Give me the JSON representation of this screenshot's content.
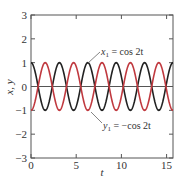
{
  "chart_data": {
    "type": "line",
    "title": "",
    "xlabel": "t",
    "ylabel": "x, y",
    "xlim": [
      0,
      15.708
    ],
    "ylim": [
      -3,
      3
    ],
    "x_ticks": [
      0,
      5,
      10,
      15
    ],
    "y_ticks": [
      -3,
      -2,
      -1,
      0,
      1,
      2,
      3
    ],
    "x_tick_labels": [
      "0",
      "5",
      "10",
      "15"
    ],
    "y_tick_labels": [
      "−3",
      "−2",
      "−1",
      "0",
      "1",
      "2",
      "3"
    ],
    "grid": false,
    "zero_line": true,
    "series": [
      {
        "name": "x1 = cos 2t",
        "formula": "cos(2t)",
        "color": "#222222",
        "amplitude": 1,
        "angular_frequency": 2,
        "sign": 1
      },
      {
        "name": "y1 = −cos 2t",
        "formula": "-cos(2t)",
        "color": "#c0393f",
        "amplitude": 1,
        "angular_frequency": 2,
        "sign": -1
      }
    ],
    "annotations": [
      {
        "text_main": "x",
        "text_sub": "1",
        "text_rest": " = cos 2t",
        "points_to": "x1 = cos 2t"
      },
      {
        "text_main": "y",
        "text_sub": "1",
        "text_rest": " = −cos 2t",
        "points_to": "y1 = −cos 2t"
      }
    ]
  },
  "colors": {
    "frame": "#555555",
    "zero_line": "#555555",
    "background": "#ffffff"
  }
}
